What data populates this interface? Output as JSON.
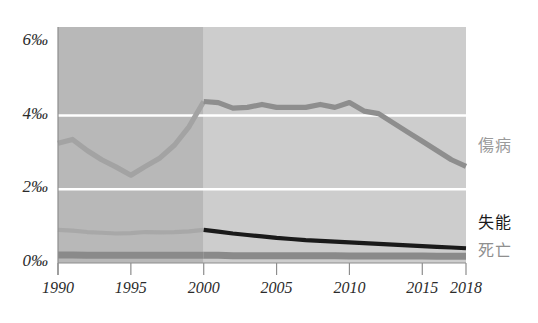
{
  "chart_data": {
    "type": "line",
    "title": "",
    "xlabel": "",
    "ylabel": "",
    "xlim": [
      1990,
      2018
    ],
    "ylim": [
      0,
      6.4
    ],
    "y_unit": "per mille",
    "grid": "horizontal white gridlines at 2, 4 per mille",
    "legend_position": "right-of-plot, inline at series end",
    "x_ticks": [
      1990,
      1995,
      2000,
      2005,
      2010,
      2015,
      2018
    ],
    "x_tick_labels": [
      "1990",
      "1995",
      "2000",
      "2005",
      "2010",
      "2015",
      "2018"
    ],
    "y_ticks": [
      0,
      2,
      4,
      6
    ],
    "y_tick_labels": [
      "0‰",
      "2‰",
      "4‰",
      "6‰"
    ],
    "shaded_regions": [
      {
        "name": "historic-band",
        "from": 1990,
        "to": 2000,
        "fill": "#b8b8b8"
      },
      {
        "name": "recent-band",
        "from": 2000,
        "to": 2018,
        "fill": "#cdcdcd"
      }
    ],
    "series": [
      {
        "name": "傷病",
        "label": "傷病",
        "color": "#8e8e8e",
        "color_pre2000": "#a3a3a3",
        "x": [
          1990,
          1991,
          1992,
          1993,
          1994,
          1995,
          1996,
          1997,
          1998,
          1999,
          2000,
          2001,
          2002,
          2003,
          2004,
          2005,
          2006,
          2007,
          2008,
          2009,
          2010,
          2011,
          2012,
          2013,
          2014,
          2015,
          2016,
          2017,
          2018
        ],
        "values": [
          3.25,
          3.35,
          3.05,
          2.8,
          2.6,
          2.38,
          2.62,
          2.85,
          3.2,
          3.7,
          4.38,
          4.35,
          4.2,
          4.22,
          4.3,
          4.22,
          4.22,
          4.22,
          4.3,
          4.22,
          4.35,
          4.12,
          4.05,
          3.8,
          3.55,
          3.3,
          3.05,
          2.8,
          2.62
        ]
      },
      {
        "name": "失能",
        "label": "失能",
        "color": "#1a1a1a",
        "color_pre2000": "#a8a8a8",
        "x": [
          1990,
          1991,
          1992,
          1993,
          1994,
          1995,
          1996,
          1997,
          1998,
          1999,
          2000,
          2001,
          2002,
          2003,
          2004,
          2005,
          2006,
          2007,
          2008,
          2009,
          2010,
          2011,
          2012,
          2013,
          2014,
          2015,
          2016,
          2017,
          2018
        ],
        "values": [
          0.9,
          0.88,
          0.84,
          0.82,
          0.8,
          0.81,
          0.84,
          0.83,
          0.84,
          0.86,
          0.9,
          0.85,
          0.8,
          0.76,
          0.72,
          0.68,
          0.65,
          0.62,
          0.6,
          0.58,
          0.56,
          0.54,
          0.52,
          0.5,
          0.48,
          0.46,
          0.44,
          0.42,
          0.4
        ]
      },
      {
        "name": "死亡",
        "label": "死亡",
        "color": "#8a8a8a",
        "color_pre2000": "#8a8a8a",
        "x": [
          1990,
          1991,
          1992,
          1993,
          1994,
          1995,
          1996,
          1997,
          1998,
          1999,
          2000,
          2001,
          2002,
          2003,
          2004,
          2005,
          2006,
          2007,
          2008,
          2009,
          2010,
          2011,
          2012,
          2013,
          2014,
          2015,
          2016,
          2017,
          2018
        ],
        "values": [
          0.22,
          0.22,
          0.21,
          0.21,
          0.21,
          0.21,
          0.21,
          0.21,
          0.21,
          0.21,
          0.21,
          0.21,
          0.2,
          0.2,
          0.2,
          0.2,
          0.2,
          0.2,
          0.2,
          0.2,
          0.19,
          0.19,
          0.19,
          0.19,
          0.19,
          0.19,
          0.18,
          0.18,
          0.18
        ]
      }
    ]
  },
  "axis": {
    "y_labels": [
      {
        "key": "y6",
        "text": "6‰"
      },
      {
        "key": "y4",
        "text": "4‰"
      },
      {
        "key": "y2",
        "text": "2‰"
      },
      {
        "key": "y0",
        "text": "0‰"
      }
    ],
    "x_labels": [
      {
        "key": "x1990",
        "text": "1990"
      },
      {
        "key": "x1995",
        "text": "1995"
      },
      {
        "key": "x2000",
        "text": "2000"
      },
      {
        "key": "x2005",
        "text": "2005"
      },
      {
        "key": "x2010",
        "text": "2010"
      },
      {
        "key": "x2015",
        "text": "2015"
      },
      {
        "key": "x2018",
        "text": "2018"
      }
    ]
  },
  "legend": {
    "injury_label": "傷病",
    "disability_label": "失能",
    "death_label": "死亡"
  },
  "colors": {
    "background": "#ffffff",
    "band_historic": "#b8b8b8",
    "band_recent": "#cdcdcd",
    "gridline": "#ffffff",
    "axis": "#6f6f6f",
    "injury_line": "#8e8e8e",
    "disability_line": "#1a1a1a",
    "death_line": "#8a8a8a",
    "tick_text": "#2b2b2b"
  }
}
